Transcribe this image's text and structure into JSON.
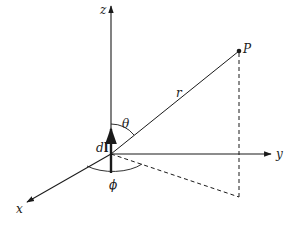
{
  "diagram": {
    "title": "",
    "colors": {
      "ink": "#1a1a1a",
      "background": "#ffffff"
    },
    "origin": {
      "x": 111,
      "y": 154
    },
    "axes": [
      {
        "name": "z",
        "label": "z",
        "tip": {
          "x": 111,
          "y": 5
        }
      },
      {
        "name": "y",
        "label": "y",
        "tip": {
          "x": 272,
          "y": 154
        }
      },
      {
        "name": "x",
        "label": "x",
        "tip": {
          "x": 26,
          "y": 203
        }
      }
    ],
    "point": {
      "label": "P",
      "x": 239,
      "y": 51
    },
    "vector_r": {
      "label": "r"
    },
    "current_element": {
      "label_italic": "d",
      "label_bold": "l"
    },
    "angles": [
      {
        "name": "theta",
        "label": "θ"
      },
      {
        "name": "phi",
        "label": "ϕ"
      }
    ],
    "projection": {
      "foot": {
        "x": 239,
        "y": 197
      },
      "style": "dashed"
    }
  }
}
